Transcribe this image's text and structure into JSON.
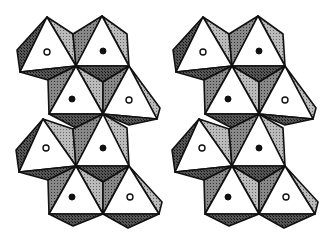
{
  "figure": {
    "panels": [
      {
        "name": "left-stereo-view",
        "offset_x": 0
      },
      {
        "name": "right-stereo-view",
        "offset_x": 163
      }
    ],
    "atoms": [
      {
        "row": 1,
        "col": 1,
        "type": "open"
      },
      {
        "row": 1,
        "col": 2,
        "type": "filled"
      },
      {
        "row": 2,
        "col": 1,
        "type": "filled"
      },
      {
        "row": 2,
        "col": 2,
        "type": "open"
      },
      {
        "row": 3,
        "col": 1,
        "type": "open"
      },
      {
        "row": 3,
        "col": 2,
        "type": "filled"
      },
      {
        "row": 4,
        "col": 1,
        "type": "filled"
      },
      {
        "row": 4,
        "col": 2,
        "type": "open"
      }
    ],
    "colors": {
      "outline": "#111111",
      "face_white": "#ffffff",
      "shade_dark": "#444444",
      "shade_light": "#aaaaaa"
    }
  }
}
